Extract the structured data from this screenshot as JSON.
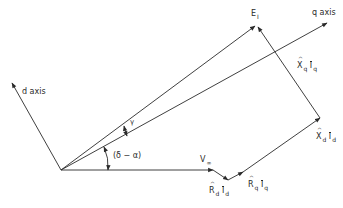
{
  "diagram": {
    "type": "phasor-diagram",
    "colors": {
      "line": "#2a2a2a",
      "background": "#ffffff"
    },
    "axes": {
      "d_axis_label": "d axis",
      "q_axis_label": "q axis"
    },
    "angles": {
      "gamma": "γ",
      "delta_minus_alpha": "(δ − α)"
    },
    "phasors": {
      "E": {
        "symbol": "E",
        "subscript": "I"
      },
      "V": {
        "symbol": "V",
        "subscript": "∞"
      },
      "RdId": {
        "symbol": "R",
        "subscript": "d",
        "current": "I",
        "current_subscript": "d"
      },
      "RqIq": {
        "symbol": "R",
        "subscript": "q",
        "current": "I",
        "current_subscript": "q"
      },
      "XdId": {
        "symbol": "X",
        "subscript": "d",
        "current": "I",
        "current_subscript": "d"
      },
      "XqIq": {
        "symbol": "X",
        "subscript": "q",
        "current": "I",
        "current_subscript": "q"
      }
    }
  }
}
